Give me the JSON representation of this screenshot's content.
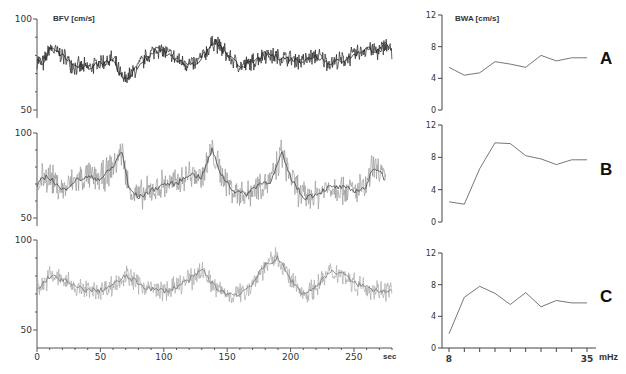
{
  "left_title": "BFV [cm/s]",
  "right_title": "BWA [cm/s]",
  "left_x_unit": "sec",
  "right_x_unit": "mHz",
  "panel_letters": [
    "A",
    "B",
    "C"
  ],
  "left_y_ticks": [
    "100",
    "50"
  ],
  "left_x_ticks": [
    "0",
    "50",
    "100",
    "150",
    "200",
    "250"
  ],
  "right_y_ticks": [
    "12",
    "8",
    "4",
    "0"
  ],
  "right_x_ticks": [
    "8",
    "35"
  ],
  "chart_data": [
    {
      "type": "line",
      "title": "BFV [cm/s] - A",
      "xlabel": "sec",
      "ylabel": "BFV [cm/s]",
      "xlim": [
        0,
        280
      ],
      "ylim": [
        50,
        100
      ],
      "x": [
        0,
        5,
        10,
        20,
        30,
        40,
        50,
        60,
        68,
        75,
        85,
        95,
        105,
        115,
        125,
        135,
        140,
        150,
        160,
        170,
        180,
        190,
        200,
        210,
        220,
        230,
        240,
        250,
        260,
        270,
        275,
        280
      ],
      "series": [
        {
          "name": "A",
          "color": "#222222",
          "values": [
            78,
            75,
            84,
            80,
            74,
            73,
            76,
            78,
            66,
            70,
            78,
            84,
            80,
            76,
            75,
            83,
            88,
            80,
            74,
            76,
            81,
            79,
            78,
            77,
            80,
            76,
            77,
            80,
            84,
            82,
            86,
            82
          ]
        }
      ]
    },
    {
      "type": "line",
      "title": "BFV [cm/s] - B",
      "xlabel": "sec",
      "ylabel": "BFV [cm/s]",
      "xlim": [
        0,
        280
      ],
      "ylim": [
        50,
        100
      ],
      "x": [
        0,
        5,
        10,
        20,
        30,
        40,
        50,
        60,
        67,
        72,
        80,
        90,
        100,
        110,
        120,
        130,
        138,
        145,
        155,
        165,
        175,
        185,
        193,
        200,
        210,
        220,
        230,
        240,
        250,
        260,
        265,
        270,
        275
      ],
      "series": [
        {
          "name": "B",
          "color": "#999999",
          "values": [
            68,
            74,
            74,
            66,
            72,
            74,
            73,
            80,
            90,
            68,
            62,
            66,
            70,
            70,
            76,
            74,
            90,
            76,
            66,
            64,
            70,
            72,
            88,
            74,
            62,
            64,
            68,
            68,
            66,
            68,
            80,
            78,
            72
          ]
        }
      ]
    },
    {
      "type": "line",
      "title": "BFV [cm/s] - C",
      "xlabel": "sec",
      "ylabel": "BFV [cm/s]",
      "xlim": [
        0,
        280
      ],
      "ylim": [
        50,
        100
      ],
      "x": [
        0,
        10,
        20,
        30,
        40,
        50,
        60,
        70,
        75,
        85,
        95,
        105,
        115,
        125,
        130,
        140,
        150,
        160,
        170,
        180,
        190,
        200,
        210,
        220,
        230,
        240,
        250,
        260,
        270,
        280
      ],
      "series": [
        {
          "name": "C",
          "color": "#aaaaaa",
          "values": [
            72,
            80,
            78,
            74,
            72,
            72,
            75,
            80,
            78,
            74,
            72,
            72,
            76,
            80,
            84,
            74,
            70,
            70,
            76,
            86,
            90,
            78,
            70,
            74,
            82,
            82,
            76,
            74,
            72,
            72
          ]
        }
      ]
    },
    {
      "type": "line",
      "title": "BWA [cm/s] - A",
      "xlabel": "mHz",
      "ylabel": "BWA [cm/s]",
      "xlim": [
        8,
        35
      ],
      "ylim": [
        0,
        12
      ],
      "x": [
        8,
        11,
        14,
        17,
        20,
        23,
        26,
        29,
        32,
        35
      ],
      "series": [
        {
          "name": "A",
          "values": [
            5.4,
            4.4,
            4.7,
            6.1,
            5.8,
            5.4,
            6.9,
            6.2,
            6.6,
            6.6
          ]
        }
      ]
    },
    {
      "type": "line",
      "title": "BWA [cm/s] - B",
      "xlabel": "mHz",
      "ylabel": "BWA [cm/s]",
      "xlim": [
        8,
        35
      ],
      "ylim": [
        0,
        12
      ],
      "x": [
        8,
        11,
        14,
        17,
        20,
        23,
        26,
        29,
        32,
        35
      ],
      "series": [
        {
          "name": "B",
          "values": [
            2.5,
            2.2,
            6.6,
            9.8,
            9.7,
            8.2,
            7.8,
            7.1,
            7.7,
            7.7
          ]
        }
      ]
    },
    {
      "type": "line",
      "title": "BWA [cm/s] - C",
      "xlabel": "mHz",
      "ylabel": "BWA [cm/s]",
      "xlim": [
        8,
        35
      ],
      "ylim": [
        0,
        12
      ],
      "x": [
        8,
        11,
        14,
        17,
        20,
        23,
        26,
        29,
        32,
        35
      ],
      "series": [
        {
          "name": "C",
          "values": [
            1.8,
            6.4,
            7.8,
            6.9,
            5.5,
            7.0,
            5.2,
            6.0,
            5.7,
            5.7
          ]
        }
      ]
    }
  ]
}
